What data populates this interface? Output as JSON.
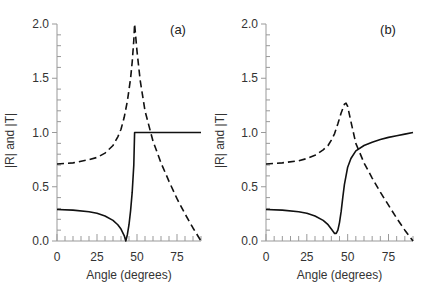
{
  "figure": {
    "ylabel": "|R| and |T|",
    "xlabel": "Angle (degrees)"
  },
  "chart_data": [
    {
      "type": "line",
      "title": "(a)",
      "panel_label": "(a)",
      "xlabel": "Angle (degrees)",
      "ylabel": "|R| and |T|",
      "xlim": [
        0,
        90
      ],
      "ylim": [
        0,
        2.0
      ],
      "xticks": [
        "0",
        "25",
        "50",
        "75"
      ],
      "yticks": [
        "0.0",
        "0.5",
        "1.0",
        "1.5",
        "2.0"
      ],
      "grid": false,
      "series": [
        {
          "name": "|R| (solid)",
          "style": "solid",
          "x": [
            0,
            10,
            20,
            25,
            30,
            35,
            38,
            40,
            42,
            43,
            44,
            45,
            46,
            47,
            48,
            48.5,
            50,
            60,
            70,
            80,
            90
          ],
          "y": [
            0.29,
            0.285,
            0.27,
            0.255,
            0.23,
            0.19,
            0.15,
            0.11,
            0.05,
            0.0,
            0.06,
            0.15,
            0.28,
            0.45,
            0.7,
            1.0,
            1.0,
            1.0,
            1.0,
            1.0,
            1.0
          ]
        },
        {
          "name": "|T| (dashed)",
          "style": "dashed",
          "x": [
            0,
            10,
            20,
            25,
            30,
            35,
            38,
            40,
            42,
            44,
            46,
            47,
            48,
            48.5,
            50,
            52,
            55,
            60,
            65,
            70,
            75,
            80,
            85,
            90
          ],
          "y": [
            0.71,
            0.72,
            0.75,
            0.77,
            0.81,
            0.88,
            0.96,
            1.03,
            1.14,
            1.29,
            1.5,
            1.65,
            1.85,
            2.0,
            1.75,
            1.48,
            1.2,
            0.92,
            0.72,
            0.55,
            0.39,
            0.25,
            0.12,
            0.0
          ]
        }
      ]
    },
    {
      "type": "line",
      "title": "(b)",
      "panel_label": "(b)",
      "xlabel": "Angle (degrees)",
      "ylabel": "|R| and |T|",
      "xlim": [
        0,
        90
      ],
      "ylim": [
        0,
        2.0
      ],
      "xticks": [
        "0",
        "25",
        "50",
        "75"
      ],
      "yticks": [
        "0.0",
        "0.5",
        "1.0",
        "1.5",
        "2.0"
      ],
      "grid": false,
      "series": [
        {
          "name": "|R| (solid)",
          "style": "solid",
          "x": [
            0,
            10,
            20,
            25,
            30,
            35,
            38,
            40,
            42,
            43,
            44,
            45,
            46,
            47,
            48,
            50,
            52,
            55,
            60,
            65,
            70,
            75,
            80,
            85,
            90
          ],
          "y": [
            0.29,
            0.285,
            0.27,
            0.255,
            0.23,
            0.19,
            0.15,
            0.11,
            0.07,
            0.07,
            0.1,
            0.17,
            0.27,
            0.4,
            0.52,
            0.68,
            0.76,
            0.83,
            0.88,
            0.91,
            0.935,
            0.955,
            0.97,
            0.985,
            1.0
          ]
        },
        {
          "name": "|T| (dashed)",
          "style": "dashed",
          "x": [
            0,
            10,
            20,
            25,
            30,
            35,
            38,
            40,
            42,
            44,
            46,
            48,
            49,
            50,
            52,
            55,
            60,
            65,
            70,
            75,
            80,
            85,
            90
          ],
          "y": [
            0.71,
            0.72,
            0.74,
            0.76,
            0.79,
            0.84,
            0.88,
            0.93,
            0.99,
            1.08,
            1.18,
            1.26,
            1.27,
            1.24,
            1.1,
            0.9,
            0.72,
            0.58,
            0.45,
            0.33,
            0.21,
            0.1,
            0.0
          ]
        }
      ]
    }
  ]
}
